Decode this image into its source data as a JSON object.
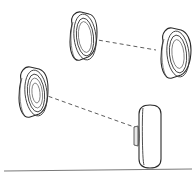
{
  "figure": {
    "title": "Wheel and axle assembly line drawing",
    "type": "technical-line-drawing",
    "background_color": "#ffffff",
    "line_color": "#2b2b2b",
    "dash_color": "#4a4a4a",
    "ground_color": "#7a7a7a",
    "canvas": {
      "width": 196,
      "height": 180
    }
  },
  "wheels": [
    {
      "id": "wheel-front-left",
      "label": "",
      "position": "top-left",
      "view": "three-quarter",
      "center_x": 86,
      "center_y": 38,
      "radius_x": 11,
      "radius_y": 26,
      "tread_depth": 15,
      "rim_rings": 2
    },
    {
      "id": "wheel-front-right",
      "label": "",
      "position": "top-right",
      "view": "three-quarter",
      "center_x": 176,
      "center_y": 55,
      "radius_x": 11,
      "radius_y": 26,
      "tread_depth": 15,
      "rim_rings": 2
    },
    {
      "id": "wheel-rear-left",
      "label": "",
      "position": "bottom-left",
      "view": "three-quarter",
      "center_x": 35,
      "center_y": 93,
      "radius_x": 11,
      "radius_y": 26,
      "tread_depth": 15,
      "rim_rings": 3
    },
    {
      "id": "wheel-rear-right",
      "label": "",
      "position": "bottom-right",
      "view": "edge-on",
      "center_x": 149,
      "center_y": 136,
      "radius_x": 10,
      "radius_y": 31,
      "tread_depth": 0,
      "rim_rings": 0
    }
  ],
  "axles": [
    {
      "id": "axle-front",
      "from_wheel": "wheel-front-left",
      "to_wheel": "wheel-front-right",
      "style": "dashed",
      "x1": 92,
      "y1": 39,
      "x2": 156,
      "y2": 50
    },
    {
      "id": "axle-rear",
      "from_wheel": "wheel-rear-left",
      "to_wheel": "wheel-rear-right",
      "style": "dashed",
      "x1": 42,
      "y1": 94,
      "x2": 137,
      "y2": 128
    }
  ],
  "ground": {
    "id": "ground-line",
    "x1": 4,
    "y1": 171,
    "x2": 192,
    "y2": 169
  }
}
